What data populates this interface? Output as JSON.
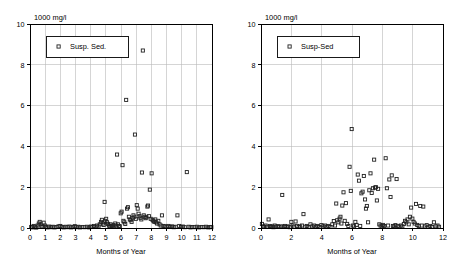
{
  "figure": {
    "background": "#ffffff",
    "marker_color": "#222222",
    "grid_color": "#b9b9b9",
    "axis_color": "#000000"
  },
  "chart_data": [
    {
      "type": "scatter",
      "panel": "left",
      "title": "",
      "unit_label": "1000 mg/l",
      "xlabel": "Months of Year",
      "ylabel": "",
      "legend": [
        "Susp. Sed."
      ],
      "legend_position": "top-left",
      "grid": true,
      "xlim": [
        0,
        12
      ],
      "ylim": [
        0,
        10
      ],
      "xticks": [
        0,
        1,
        2,
        3,
        4,
        5,
        6,
        7,
        8,
        9,
        10,
        11,
        12
      ],
      "xticklabels": [
        "0",
        "1",
        "2",
        "3",
        "4",
        "5",
        "6",
        "7",
        "8",
        "9",
        "10",
        "11",
        "12"
      ],
      "yticks": [
        0,
        2,
        4,
        6,
        8,
        10
      ],
      "yticklabels": [
        "0",
        "2",
        "4",
        "6",
        "8",
        "10"
      ],
      "marker": "open-square",
      "points": [
        [
          0.08,
          0.05
        ],
        [
          0.16,
          0.03
        ],
        [
          0.24,
          0.1
        ],
        [
          0.33,
          0.06
        ],
        [
          0.41,
          0.02
        ],
        [
          0.5,
          0.12
        ],
        [
          0.58,
          0.22
        ],
        [
          0.64,
          0.3
        ],
        [
          0.7,
          0.18
        ],
        [
          0.76,
          0.08
        ],
        [
          0.82,
          0.05
        ],
        [
          0.9,
          0.26
        ],
        [
          0.98,
          0.12
        ],
        [
          1.05,
          0.05
        ],
        [
          1.14,
          0.03
        ],
        [
          1.25,
          0.07
        ],
        [
          1.38,
          0.04
        ],
        [
          1.5,
          0.06
        ],
        [
          1.62,
          0.03
        ],
        [
          1.75,
          0.05
        ],
        [
          1.88,
          0.08
        ],
        [
          2.0,
          0.1
        ],
        [
          2.1,
          0.05
        ],
        [
          2.22,
          0.03
        ],
        [
          2.35,
          0.06
        ],
        [
          2.48,
          0.04
        ],
        [
          2.6,
          0.07
        ],
        [
          2.72,
          0.03
        ],
        [
          2.85,
          0.05
        ],
        [
          2.95,
          0.09
        ],
        [
          3.05,
          0.04
        ],
        [
          3.18,
          0.06
        ],
        [
          3.3,
          0.03
        ],
        [
          3.45,
          0.05
        ],
        [
          3.6,
          0.04
        ],
        [
          3.75,
          0.06
        ],
        [
          3.9,
          0.03
        ],
        [
          4.02,
          0.07
        ],
        [
          4.12,
          0.05
        ],
        [
          4.22,
          0.1
        ],
        [
          4.32,
          0.06
        ],
        [
          4.42,
          0.12
        ],
        [
          4.52,
          0.08
        ],
        [
          4.6,
          0.18
        ],
        [
          4.68,
          0.3
        ],
        [
          4.74,
          0.4
        ],
        [
          4.8,
          0.22
        ],
        [
          4.86,
          0.15
        ],
        [
          4.92,
          1.28
        ],
        [
          4.96,
          0.35
        ],
        [
          5.02,
          0.45
        ],
        [
          5.08,
          0.28
        ],
        [
          5.14,
          0.2
        ],
        [
          5.2,
          0.12
        ],
        [
          5.26,
          0.08
        ],
        [
          5.32,
          0.18
        ],
        [
          5.38,
          0.1
        ],
        [
          5.44,
          0.06
        ],
        [
          5.5,
          0.14
        ],
        [
          5.56,
          0.08
        ],
        [
          5.62,
          0.22
        ],
        [
          5.68,
          0.12
        ],
        [
          5.74,
          3.6
        ],
        [
          5.8,
          0.18
        ],
        [
          5.86,
          0.1
        ],
        [
          5.92,
          0.08
        ],
        [
          5.98,
          0.72
        ],
        [
          6.04,
          0.8
        ],
        [
          6.1,
          3.08
        ],
        [
          6.16,
          0.35
        ],
        [
          6.22,
          0.28
        ],
        [
          6.28,
          0.2
        ],
        [
          6.34,
          6.28
        ],
        [
          6.4,
          0.95
        ],
        [
          6.46,
          1.02
        ],
        [
          6.52,
          0.55
        ],
        [
          6.58,
          0.42
        ],
        [
          6.64,
          0.38
        ],
        [
          6.7,
          0.3
        ],
        [
          6.76,
          0.48
        ],
        [
          6.82,
          0.62
        ],
        [
          6.88,
          0.55
        ],
        [
          6.92,
          4.58
        ],
        [
          6.98,
          0.45
        ],
        [
          7.04,
          1.12
        ],
        [
          7.1,
          0.95
        ],
        [
          7.16,
          0.7
        ],
        [
          7.22,
          0.58
        ],
        [
          7.28,
          0.5
        ],
        [
          7.34,
          0.42
        ],
        [
          7.38,
          2.72
        ],
        [
          7.44,
          8.7
        ],
        [
          7.5,
          0.62
        ],
        [
          7.56,
          0.55
        ],
        [
          7.62,
          0.48
        ],
        [
          7.68,
          0.52
        ],
        [
          7.74,
          1.05
        ],
        [
          7.78,
          1.1
        ],
        [
          7.84,
          0.58
        ],
        [
          7.9,
          1.88
        ],
        [
          7.96,
          0.45
        ],
        [
          8.02,
          2.68
        ],
        [
          8.08,
          0.4
        ],
        [
          8.14,
          0.35
        ],
        [
          8.2,
          0.3
        ],
        [
          8.26,
          0.42
        ],
        [
          8.32,
          0.28
        ],
        [
          8.38,
          0.22
        ],
        [
          8.46,
          0.35
        ],
        [
          8.54,
          0.18
        ],
        [
          8.62,
          0.12
        ],
        [
          8.7,
          0.62
        ],
        [
          8.8,
          0.1
        ],
        [
          8.9,
          0.08
        ],
        [
          9.0,
          0.06
        ],
        [
          9.12,
          0.1
        ],
        [
          9.24,
          0.05
        ],
        [
          9.36,
          0.08
        ],
        [
          9.48,
          0.04
        ],
        [
          9.6,
          0.06
        ],
        [
          9.72,
          0.62
        ],
        [
          9.84,
          0.1
        ],
        [
          9.96,
          0.05
        ],
        [
          10.08,
          0.07
        ],
        [
          10.2,
          0.04
        ],
        [
          10.34,
          2.74
        ],
        [
          10.46,
          0.06
        ],
        [
          10.58,
          0.03
        ],
        [
          10.7,
          0.05
        ],
        [
          10.85,
          0.04
        ],
        [
          11.0,
          0.06
        ],
        [
          11.15,
          0.03
        ],
        [
          11.3,
          0.05
        ],
        [
          11.45,
          0.04
        ],
        [
          11.6,
          0.06
        ],
        [
          11.75,
          0.03
        ],
        [
          11.88,
          0.05
        ],
        [
          11.96,
          0.04
        ]
      ]
    },
    {
      "type": "scatter",
      "panel": "right",
      "title": "",
      "unit_label": "1000 mg/l",
      "xlabel": "Months of Year",
      "ylabel": "",
      "legend": [
        "Susp-Sed"
      ],
      "legend_position": "top-left",
      "grid": true,
      "xlim": [
        0,
        12
      ],
      "ylim": [
        0,
        10
      ],
      "xticks": [
        0,
        2,
        4,
        6,
        8,
        10,
        12
      ],
      "xticklabels": [
        "0",
        "2",
        "4",
        "6",
        "8",
        "10",
        "12"
      ],
      "yticks": [
        0,
        2,
        4,
        6,
        8,
        10
      ],
      "yticklabels": [
        "0",
        "2",
        "4",
        "6",
        "8",
        "10"
      ],
      "marker": "open-square",
      "points": [
        [
          0.06,
          0.2
        ],
        [
          0.14,
          0.08
        ],
        [
          0.22,
          0.05
        ],
        [
          0.3,
          0.12
        ],
        [
          0.4,
          0.06
        ],
        [
          0.5,
          0.42
        ],
        [
          0.58,
          0.1
        ],
        [
          0.66,
          0.05
        ],
        [
          0.74,
          0.08
        ],
        [
          0.82,
          0.04
        ],
        [
          0.9,
          0.12
        ],
        [
          1.0,
          0.06
        ],
        [
          1.1,
          0.09
        ],
        [
          1.2,
          0.05
        ],
        [
          1.32,
          0.08
        ],
        [
          1.4,
          1.62
        ],
        [
          1.48,
          0.06
        ],
        [
          1.58,
          0.1
        ],
        [
          1.68,
          0.05
        ],
        [
          1.78,
          0.08
        ],
        [
          1.9,
          0.04
        ],
        [
          2.0,
          0.3
        ],
        [
          2.08,
          0.12
        ],
        [
          2.18,
          0.06
        ],
        [
          2.28,
          0.32
        ],
        [
          2.38,
          0.1
        ],
        [
          2.48,
          0.05
        ],
        [
          2.58,
          0.08
        ],
        [
          2.7,
          0.12
        ],
        [
          2.8,
          0.68
        ],
        [
          2.92,
          0.06
        ],
        [
          3.02,
          0.1
        ],
        [
          3.14,
          0.05
        ],
        [
          3.26,
          0.18
        ],
        [
          3.38,
          0.08
        ],
        [
          3.5,
          0.12
        ],
        [
          3.62,
          0.06
        ],
        [
          3.74,
          0.1
        ],
        [
          3.86,
          0.05
        ],
        [
          3.98,
          0.14
        ],
        [
          4.1,
          0.08
        ],
        [
          4.22,
          0.12
        ],
        [
          4.34,
          0.06
        ],
        [
          4.46,
          0.1
        ],
        [
          4.58,
          0.05
        ],
        [
          4.7,
          0.18
        ],
        [
          4.8,
          0.34
        ],
        [
          4.88,
          0.12
        ],
        [
          4.96,
          1.2
        ],
        [
          5.02,
          0.38
        ],
        [
          5.1,
          0.28
        ],
        [
          5.18,
          0.46
        ],
        [
          5.24,
          0.55
        ],
        [
          5.3,
          0.22
        ],
        [
          5.36,
          1.1
        ],
        [
          5.44,
          1.75
        ],
        [
          5.52,
          0.35
        ],
        [
          5.6,
          1.22
        ],
        [
          5.68,
          0.2
        ],
        [
          5.76,
          0.1
        ],
        [
          5.84,
          3.0
        ],
        [
          5.92,
          1.82
        ],
        [
          5.98,
          4.85
        ],
        [
          6.06,
          0.12
        ],
        [
          6.14,
          0.08
        ],
        [
          6.22,
          0.3
        ],
        [
          6.3,
          0.15
        ],
        [
          6.38,
          2.62
        ],
        [
          6.46,
          2.32
        ],
        [
          6.54,
          0.1
        ],
        [
          6.62,
          1.7
        ],
        [
          6.7,
          1.78
        ],
        [
          6.78,
          2.55
        ],
        [
          6.86,
          1.4
        ],
        [
          6.92,
          0.95
        ],
        [
          6.98,
          1.08
        ],
        [
          7.06,
          0.28
        ],
        [
          7.14,
          1.85
        ],
        [
          7.22,
          2.68
        ],
        [
          7.3,
          1.72
        ],
        [
          7.38,
          1.95
        ],
        [
          7.46,
          3.35
        ],
        [
          7.52,
          1.98
        ],
        [
          7.58,
          2.0
        ],
        [
          7.64,
          1.35
        ],
        [
          7.72,
          1.92
        ],
        [
          7.8,
          0.18
        ],
        [
          7.88,
          0.12
        ],
        [
          7.96,
          0.08
        ],
        [
          8.04,
          0.15
        ],
        [
          8.12,
          0.1
        ],
        [
          8.22,
          3.42
        ],
        [
          8.3,
          1.95
        ],
        [
          8.38,
          0.12
        ],
        [
          8.46,
          2.38
        ],
        [
          8.54,
          1.52
        ],
        [
          8.62,
          2.58
        ],
        [
          8.7,
          0.1
        ],
        [
          8.78,
          0.08
        ],
        [
          8.86,
          0.14
        ],
        [
          8.94,
          2.4
        ],
        [
          9.02,
          0.1
        ],
        [
          9.12,
          0.06
        ],
        [
          9.22,
          0.12
        ],
        [
          9.32,
          0.08
        ],
        [
          9.42,
          0.2
        ],
        [
          9.5,
          0.35
        ],
        [
          9.58,
          0.28
        ],
        [
          9.66,
          0.42
        ],
        [
          9.74,
          0.18
        ],
        [
          9.82,
          0.55
        ],
        [
          9.9,
          1.0
        ],
        [
          9.98,
          0.46
        ],
        [
          10.06,
          0.3
        ],
        [
          10.14,
          0.22
        ],
        [
          10.22,
          1.18
        ],
        [
          10.3,
          0.15
        ],
        [
          10.4,
          0.1
        ],
        [
          10.5,
          1.08
        ],
        [
          10.6,
          0.12
        ],
        [
          10.7,
          1.05
        ],
        [
          10.8,
          0.08
        ],
        [
          10.92,
          0.14
        ],
        [
          11.04,
          0.06
        ],
        [
          11.16,
          0.1
        ],
        [
          11.28,
          0.05
        ],
        [
          11.4,
          0.28
        ],
        [
          11.52,
          0.08
        ],
        [
          11.64,
          0.12
        ],
        [
          11.74,
          0.06
        ]
      ]
    }
  ]
}
